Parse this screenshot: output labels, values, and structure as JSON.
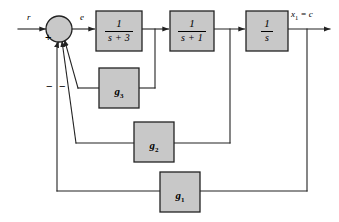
{
  "diagram": {
    "canvas": {
      "width": 339,
      "height": 222,
      "background": "#ffffff"
    },
    "colors": {
      "block_fill": "#c8c8c8",
      "block_stroke": "#222222",
      "line": "#222222",
      "text": "#000000"
    },
    "blocks": [
      {
        "id": "g_s3",
        "kind": "transfer-function",
        "numerator": "1",
        "denominator": "s + 3",
        "x": 96,
        "y": 11,
        "w": 46,
        "h": 40
      },
      {
        "id": "g_s1",
        "kind": "transfer-function",
        "numerator": "1",
        "denominator": "s + 1",
        "x": 170,
        "y": 11,
        "w": 44,
        "h": 40
      },
      {
        "id": "g_int",
        "kind": "transfer-function",
        "numerator": "1",
        "denominator": "s",
        "x": 246,
        "y": 11,
        "w": 42,
        "h": 40
      },
      {
        "id": "g3",
        "kind": "gain",
        "label": "g",
        "subscript": "3",
        "x": 99,
        "y": 68,
        "w": 40,
        "h": 40
      },
      {
        "id": "g2",
        "kind": "gain",
        "label": "g",
        "subscript": "2",
        "x": 134,
        "y": 122,
        "w": 40,
        "h": 40
      },
      {
        "id": "g1",
        "kind": "gain",
        "label": "g",
        "subscript": "1",
        "x": 160,
        "y": 172,
        "w": 40,
        "h": 40
      }
    ],
    "summing_junction": {
      "id": "sum",
      "cx": 59,
      "cy": 29,
      "r": 13,
      "plus_label": "+",
      "minus_labels": [
        "−",
        "−"
      ],
      "inputs": [
        "r"
      ],
      "negative_feedback_count": 3
    },
    "signals": [
      {
        "id": "r",
        "label": "r",
        "x": 27,
        "y": 11
      },
      {
        "id": "e",
        "label": "e",
        "x": 80,
        "y": 11
      },
      {
        "id": "out",
        "label": "x",
        "subscript": "1",
        "suffix": " = c",
        "x": 292,
        "y": 10
      }
    ],
    "labels": {
      "r": "r",
      "e": "e",
      "output_var": "x",
      "output_sub": "1",
      "output_eq": " = c",
      "plus": "+",
      "minus": "−",
      "block1_num": "1",
      "block1_den": "s + 3",
      "block2_num": "1",
      "block2_den": "s + 1",
      "block3_num": "1",
      "block3_den": "s",
      "g1": "g",
      "g1_sub": "1",
      "g2": "g",
      "g2_sub": "2",
      "g3": "g",
      "g3_sub": "3"
    },
    "connections": [
      {
        "from": "r-input",
        "to": "sum",
        "type": "arrow"
      },
      {
        "from": "sum",
        "to": "g_s3",
        "type": "arrow",
        "label": "e"
      },
      {
        "from": "g_s3",
        "to": "g_s1",
        "type": "arrow"
      },
      {
        "from": "g_s1",
        "to": "g_int",
        "type": "arrow"
      },
      {
        "from": "g_int",
        "to": "output",
        "type": "arrow",
        "label": "x1 = c"
      },
      {
        "from": "g_s3-out-tap",
        "to": "g3",
        "type": "feedback"
      },
      {
        "from": "g3",
        "to": "sum",
        "type": "feedback-negative"
      },
      {
        "from": "g_s1-out-tap",
        "to": "g2",
        "type": "feedback"
      },
      {
        "from": "g2",
        "to": "sum",
        "type": "feedback-negative"
      },
      {
        "from": "output-tap",
        "to": "g1",
        "type": "feedback"
      },
      {
        "from": "g1",
        "to": "sum",
        "type": "feedback-negative"
      }
    ]
  }
}
